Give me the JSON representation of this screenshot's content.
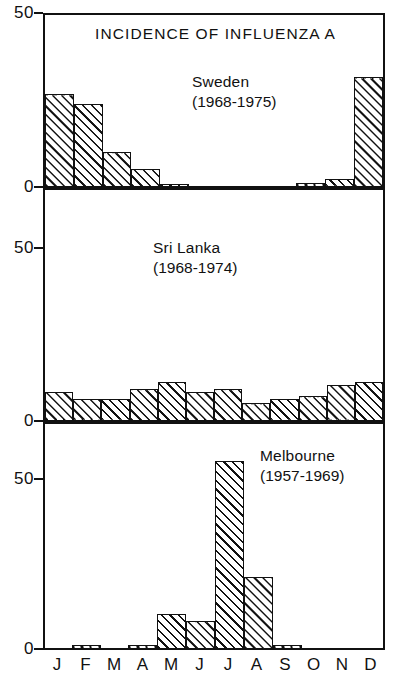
{
  "chart_data": {
    "type": "bar",
    "title": "INCIDENCE OF INFLUENZA A",
    "xlabel": "",
    "ylabel": "",
    "ylim": [
      0,
      50
    ],
    "grid": false,
    "legend": "none",
    "categories": [
      "J",
      "F",
      "M",
      "A",
      "M",
      "J",
      "J",
      "A",
      "S",
      "O",
      "N",
      "D"
    ],
    "panels": [
      {
        "name": "Sweden",
        "years": "(1968-1975)",
        "ytick_labels": [
          "50",
          "0"
        ],
        "ylim": [
          0,
          50
        ],
        "values": [
          27,
          24,
          10,
          5,
          0.6,
          0,
          0,
          0,
          0,
          1,
          2,
          32
        ]
      },
      {
        "name": "Sri Lanka",
        "years": "(1968-1974)",
        "ytick_labels": [
          "50",
          "0"
        ],
        "ylim": [
          0,
          50
        ],
        "values": [
          8,
          6,
          6,
          9,
          11,
          8,
          9,
          5,
          6,
          7,
          10,
          11
        ]
      },
      {
        "name": "Melbourne",
        "years": "(1957-1969)",
        "ytick_labels": [
          "50",
          "0"
        ],
        "ylim": [
          0,
          50
        ],
        "values": [
          0,
          1,
          0,
          1,
          10,
          8,
          55,
          21,
          1,
          0,
          0,
          0
        ]
      }
    ]
  },
  "axis": {
    "top_tick_sweden": "50",
    "zero_tick_sweden": "0",
    "top_tick_srilanka": "50",
    "zero_tick_srilanka": "0",
    "top_tick_melbourne": "50",
    "zero_tick_melbourne": "0"
  },
  "colors": {
    "ink": "#111111",
    "paper": "#ffffff"
  }
}
